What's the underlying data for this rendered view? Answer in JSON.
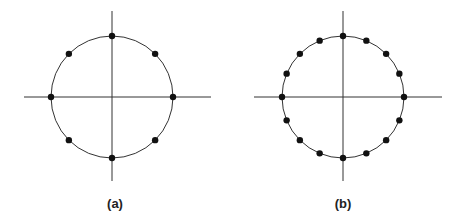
{
  "figure": {
    "panels": [
      {
        "id": "a",
        "caption": "(a)",
        "description": "Unit circle with 8 equally spaced points",
        "points_count": 8,
        "center": [
          112,
          97
        ],
        "radius": 61,
        "axis_extent": {
          "x": [
            24,
            211
          ],
          "y": [
            11,
            181
          ]
        },
        "caption_pos": [
          115,
          196
        ]
      },
      {
        "id": "b",
        "caption": "(b)",
        "description": "Unit circle with 16 equally spaced points",
        "points_count": 16,
        "center": [
          343,
          97
        ],
        "radius": 61,
        "axis_extent": {
          "x": [
            254,
            442
          ],
          "y": [
            11,
            181
          ]
        },
        "caption_pos": [
          343,
          196
        ]
      }
    ],
    "colors": {
      "line": "#333333",
      "point": "#111111",
      "caption": "#222222"
    }
  }
}
